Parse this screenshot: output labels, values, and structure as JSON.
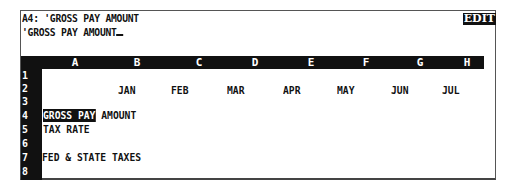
{
  "control_panel": {
    "cell_address": "A4:",
    "cell_contents": " 'GROSS PAY AMOUNT",
    "edit_line": "'GROSS PAY AMOUNT",
    "mode_indicator": "EDIT"
  },
  "columns": [
    "A",
    "B",
    "C",
    "D",
    "E",
    "F",
    "G",
    "H"
  ],
  "rows": [
    "1",
    "2",
    "3",
    "4",
    "5",
    "6",
    "7",
    "8"
  ],
  "cells": {
    "B2": "JAN",
    "C2": "FEB",
    "D2": "MAR",
    "E2": "APR",
    "F2": "MAY",
    "G2": "JUN",
    "H2": "JUL",
    "A4_highlight": "GROSS PAY",
    "A4_rest": " AMOUNT",
    "A5": "TAX RATE",
    "A7": "FED & STATE TAXES"
  },
  "active_cell": "A4",
  "colors": {
    "foreground": "#111111",
    "background": "#ffffff"
  }
}
